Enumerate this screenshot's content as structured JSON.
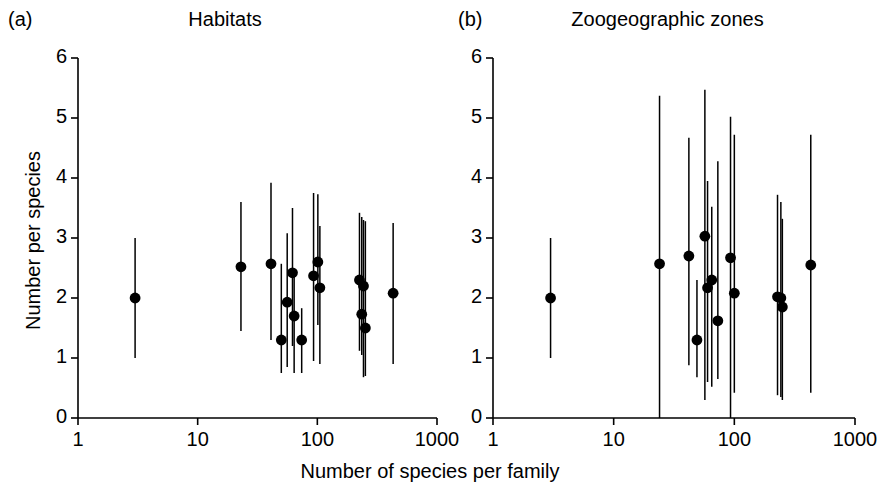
{
  "figure": {
    "background_color": "#ffffff",
    "ink_color": "#000000",
    "xlabel": "Number of species per family"
  },
  "chart_data": [
    {
      "type": "scatter",
      "panel": "(a)",
      "title": "Habitats",
      "xlabel": "Number of species per family",
      "ylabel": "Number per species",
      "xscale": "log",
      "xlim": [
        1,
        1000
      ],
      "ylim": [
        0,
        6
      ],
      "xticks": [
        1,
        10,
        100,
        1000
      ],
      "xtick_labels": [
        "1",
        "10",
        "100",
        "1000"
      ],
      "yticks": [
        0,
        1,
        2,
        3,
        4,
        5,
        6
      ],
      "ytick_labels": [
        "0",
        "1",
        "2",
        "3",
        "4",
        "5",
        "6"
      ],
      "grid": false,
      "legend": "none",
      "marker": "filled-circle",
      "errorbars": true,
      "points": [
        {
          "x": 3,
          "y": 2.0,
          "lo": 1.0,
          "hi": 3.0
        },
        {
          "x": 23,
          "y": 2.52,
          "lo": 1.45,
          "hi": 3.6
        },
        {
          "x": 41,
          "y": 2.57,
          "lo": 1.3,
          "hi": 3.92
        },
        {
          "x": 50,
          "y": 1.3,
          "lo": 0.75,
          "hi": 2.57
        },
        {
          "x": 56,
          "y": 1.93,
          "lo": 0.85,
          "hi": 3.08
        },
        {
          "x": 62,
          "y": 2.42,
          "lo": 1.2,
          "hi": 3.5
        },
        {
          "x": 64,
          "y": 1.7,
          "lo": 0.75,
          "hi": 2.45
        },
        {
          "x": 74,
          "y": 1.3,
          "lo": 0.75,
          "hi": 1.83
        },
        {
          "x": 93,
          "y": 2.37,
          "lo": 0.95,
          "hi": 3.75
        },
        {
          "x": 101,
          "y": 2.6,
          "lo": 1.55,
          "hi": 3.73
        },
        {
          "x": 105,
          "y": 2.17,
          "lo": 0.9,
          "hi": 3.2
        },
        {
          "x": 225,
          "y": 2.3,
          "lo": 1.12,
          "hi": 3.42
        },
        {
          "x": 243,
          "y": 2.2,
          "lo": 0.68,
          "hi": 3.3
        },
        {
          "x": 235,
          "y": 1.73,
          "lo": 1.05,
          "hi": 3.35
        },
        {
          "x": 252,
          "y": 1.5,
          "lo": 0.7,
          "hi": 3.28
        },
        {
          "x": 430,
          "y": 2.08,
          "lo": 0.9,
          "hi": 3.25
        }
      ]
    },
    {
      "type": "scatter",
      "panel": "(b)",
      "title": "Zoogeographic zones",
      "xlabel": "Number of species per family",
      "ylabel": "Number per species",
      "xscale": "log",
      "xlim": [
        1,
        1000
      ],
      "ylim": [
        0,
        6
      ],
      "xticks": [
        1,
        10,
        100,
        1000
      ],
      "xtick_labels": [
        "1",
        "10",
        "100",
        "1000"
      ],
      "yticks": [
        0,
        1,
        2,
        3,
        4,
        5,
        6
      ],
      "ytick_labels": [
        "0",
        "1",
        "2",
        "3",
        "4",
        "5",
        "6"
      ],
      "grid": false,
      "legend": "none",
      "marker": "filled-circle",
      "errorbars": true,
      "points": [
        {
          "x": 3,
          "y": 2.0,
          "lo": 1.0,
          "hi": 3.0
        },
        {
          "x": 24,
          "y": 2.57,
          "lo": 0.0,
          "hi": 5.37
        },
        {
          "x": 42,
          "y": 2.7,
          "lo": 0.88,
          "hi": 4.67
        },
        {
          "x": 49,
          "y": 1.3,
          "lo": 0.68,
          "hi": 2.3
        },
        {
          "x": 57,
          "y": 3.03,
          "lo": 0.3,
          "hi": 5.47
        },
        {
          "x": 60,
          "y": 2.17,
          "lo": 0.6,
          "hi": 3.95
        },
        {
          "x": 65,
          "y": 2.3,
          "lo": 0.52,
          "hi": 3.52
        },
        {
          "x": 73,
          "y": 1.62,
          "lo": 0.65,
          "hi": 4.28
        },
        {
          "x": 93,
          "y": 2.67,
          "lo": 0.0,
          "hi": 5.02
        },
        {
          "x": 100,
          "y": 2.08,
          "lo": 0.42,
          "hi": 4.72
        },
        {
          "x": 228,
          "y": 2.02,
          "lo": 0.38,
          "hi": 3.72
        },
        {
          "x": 243,
          "y": 2.0,
          "lo": 0.35,
          "hi": 3.6
        },
        {
          "x": 250,
          "y": 1.85,
          "lo": 0.3,
          "hi": 3.32
        },
        {
          "x": 430,
          "y": 2.55,
          "lo": 0.42,
          "hi": 4.72
        }
      ]
    }
  ]
}
